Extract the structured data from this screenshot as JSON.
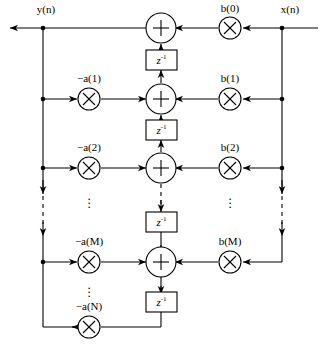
{
  "diagram": {
    "signals": {
      "input_label": "x(n)",
      "output_label": "y(n)"
    },
    "delay_label": "z",
    "delay_exponent": "-1",
    "ellipsis": "⋮",
    "colors": {
      "line": "#000000",
      "background": "#ffffff"
    },
    "feedback_coefficients": [
      {
        "label": "−a(1)",
        "row": 1
      },
      {
        "label": "−a(2)",
        "row": 2
      },
      {
        "label": "−a(M)",
        "row": 3
      },
      {
        "label": "−a(N)",
        "row": 4
      }
    ],
    "feedforward_coefficients": [
      {
        "label": "b(0)",
        "row": 0
      },
      {
        "label": "b(1)",
        "row": 1
      },
      {
        "label": "b(2)",
        "row": 2
      },
      {
        "label": "b(M)",
        "row": 3
      }
    ],
    "adders": [
      {
        "name": "adder-0",
        "symbol": "+"
      },
      {
        "name": "adder-1",
        "symbol": "+"
      },
      {
        "name": "adder-2",
        "symbol": "+"
      },
      {
        "name": "adder-3",
        "symbol": "+"
      }
    ],
    "multiplier_symbol": "×",
    "delay_elements": 4
  }
}
